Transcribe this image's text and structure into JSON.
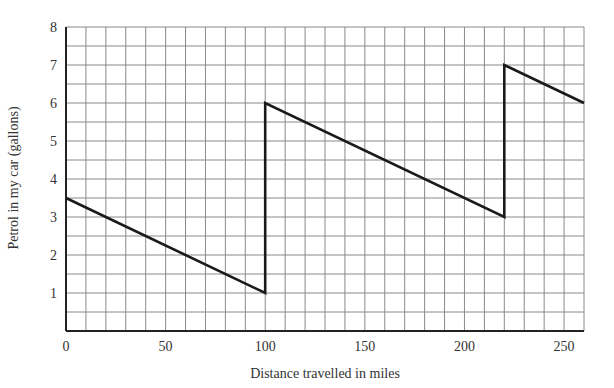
{
  "chart_data": {
    "type": "line",
    "title": "",
    "xlabel": "Distance travelled in miles",
    "ylabel": "Petrol in my car (gallons)",
    "xlim": [
      0,
      260
    ],
    "ylim": [
      0,
      8
    ],
    "x_ticks": [
      0,
      50,
      100,
      150,
      200,
      250
    ],
    "y_ticks": [
      1,
      2,
      3,
      4,
      5,
      6,
      7,
      8
    ],
    "grid": true,
    "grid_x_step": 10,
    "grid_y_step": 0.5,
    "legend": null,
    "series": [
      {
        "name": "Petrol",
        "x": [
          0,
          100,
          100,
          220,
          220,
          260
        ],
        "y": [
          3.5,
          1,
          6,
          3,
          7,
          6
        ]
      }
    ]
  }
}
